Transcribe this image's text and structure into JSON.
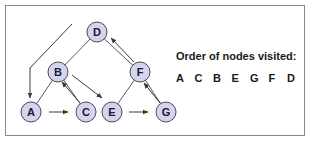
{
  "diagram": {
    "type": "tree-traversal",
    "colors": {
      "node_fill": "#d4d4ee",
      "node_stroke": "#4a4a5a",
      "edge": "#5a5a5a",
      "frame": "#8a8a8a",
      "text": "#1a1a1a"
    },
    "nodes": [
      {
        "id": "D",
        "label": "D",
        "x": 97,
        "y": 32
      },
      {
        "id": "B",
        "label": "B",
        "x": 58,
        "y": 72
      },
      {
        "id": "F",
        "label": "F",
        "x": 140,
        "y": 72
      },
      {
        "id": "A",
        "label": "A",
        "x": 31,
        "y": 112
      },
      {
        "id": "C",
        "label": "C",
        "x": 86,
        "y": 112
      },
      {
        "id": "E",
        "label": "E",
        "x": 112,
        "y": 112
      },
      {
        "id": "G",
        "label": "G",
        "x": 166,
        "y": 112
      }
    ],
    "tree_edges": [
      [
        "D",
        "B"
      ],
      [
        "D",
        "F"
      ],
      [
        "B",
        "A"
      ],
      [
        "B",
        "C"
      ],
      [
        "F",
        "E"
      ],
      [
        "F",
        "G"
      ]
    ],
    "traversal_arrows": [
      {
        "from": "start",
        "to": "A"
      },
      {
        "from": "A",
        "to": "C"
      },
      {
        "from": "C",
        "to": "B"
      },
      {
        "from": "B",
        "to": "E"
      },
      {
        "from": "E",
        "to": "G"
      },
      {
        "from": "G",
        "to": "F"
      },
      {
        "from": "F",
        "to": "D"
      }
    ]
  },
  "panel": {
    "title": "Order of nodes visited:",
    "order": [
      "A",
      "C",
      "B",
      "E",
      "G",
      "F",
      "D"
    ]
  }
}
